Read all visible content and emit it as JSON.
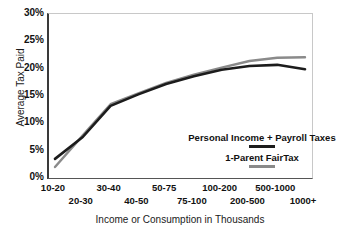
{
  "chart_data": {
    "type": "line",
    "title": "",
    "xlabel": "Income or Consumption in Thousands",
    "ylabel": "Average Tax Paid",
    "categories": [
      "10-20",
      "20-30",
      "30-40",
      "40-50",
      "50-75",
      "75-100",
      "100-200",
      "200-500",
      "500-1000",
      "1000+"
    ],
    "ylim": [
      0,
      30
    ],
    "yticks": [
      "0%",
      "5%",
      "10%",
      "15%",
      "20%",
      "25%",
      "30%"
    ],
    "ytick_values": [
      0,
      5,
      10,
      15,
      20,
      25,
      30
    ],
    "grid": false,
    "legend_position": "inside-center-lower",
    "series": [
      {
        "name": "Personal Income + Payroll Taxes",
        "color": "#1c1c1c",
        "values": [
          3.5,
          7.5,
          13.2,
          15.3,
          17.2,
          18.6,
          19.8,
          20.5,
          20.7,
          19.9
        ]
      },
      {
        "name": "1-Parent FairTax",
        "color": "#8a8a8a",
        "values": [
          2.0,
          7.8,
          13.5,
          15.5,
          17.4,
          18.9,
          20.2,
          21.4,
          22.0,
          22.1
        ]
      }
    ]
  },
  "axes": {
    "y_title": "Average Tax Paid",
    "x_title": "Income or Consumption in Thousands",
    "y_tick_labels": [
      "30%",
      "25%",
      "20%",
      "15%",
      "10%",
      "5%",
      "0%"
    ],
    "x_tick_labels": [
      "10-20",
      "20-30",
      "30-40",
      "40-50",
      "50-75",
      "75-100",
      "100-200",
      "200-500",
      "500-1000",
      "1000+"
    ]
  },
  "legend": {
    "entries": [
      {
        "label": "Personal Income + Payroll Taxes",
        "color": "#1c1c1c"
      },
      {
        "label": "1-Parent FairTax",
        "color": "#8a8a8a"
      }
    ]
  },
  "colors": {
    "series_black": "#1c1c1c",
    "series_gray": "#8a8a8a",
    "axis": "#3a3a3a",
    "background": "#ffffff",
    "text": "#111111"
  }
}
